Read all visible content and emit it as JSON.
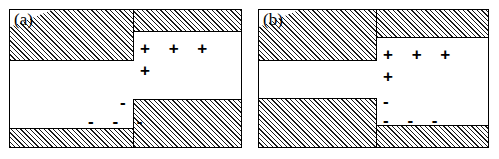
{
  "figure": {
    "type": "schematic-diagram",
    "background_color": "#ffffff",
    "line_color": "#000000",
    "hatch_fill_color": "#efefef",
    "panels": [
      {
        "id": "a",
        "label": "(a)",
        "symbols": {
          "plus_row": "+ + +",
          "plus_single": "+",
          "minus_single": "-",
          "minus_row": "- - -"
        },
        "blocks": [
          {
            "name": "top-left-block",
            "x": 0,
            "y": 0,
            "w": 123,
            "h": 50
          },
          {
            "name": "top-right-block",
            "x": 123,
            "y": 0,
            "w": 107,
            "h": 22
          },
          {
            "name": "bottom-left-block",
            "x": 0,
            "y": 118,
            "w": 123,
            "h": 18
          },
          {
            "name": "bottom-right-block",
            "x": 123,
            "y": 89,
            "w": 107,
            "h": 47
          }
        ]
      },
      {
        "id": "b",
        "label": "(b)",
        "symbols": {
          "plus_row": "+ + +",
          "plus_single": "+",
          "minus_single": "-",
          "minus_row": "- - -"
        },
        "blocks": [
          {
            "name": "top-left-block",
            "x": 0,
            "y": 0,
            "w": 117,
            "h": 50
          },
          {
            "name": "top-right-block",
            "x": 117,
            "y": 0,
            "w": 111,
            "h": 28
          },
          {
            "name": "bottom-left-block",
            "x": 0,
            "y": 88,
            "w": 117,
            "h": 48
          },
          {
            "name": "bottom-right-block",
            "x": 117,
            "y": 115,
            "w": 111,
            "h": 21
          }
        ]
      }
    ]
  }
}
